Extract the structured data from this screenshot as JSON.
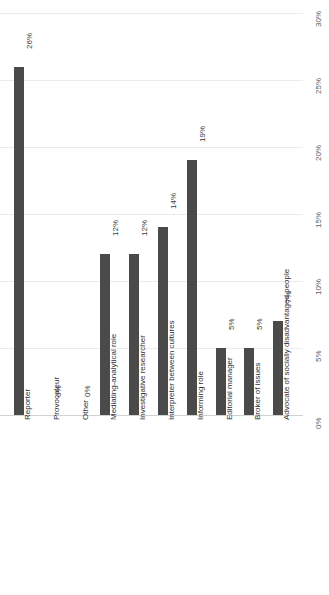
{
  "chart_data": {
    "type": "bar",
    "title": "",
    "xlabel": "",
    "ylabel": "",
    "ylim": [
      0,
      30
    ],
    "orientation": "vertical-rotated",
    "grid": true,
    "legend": "none",
    "axis_ticks": [
      "0%",
      "5%",
      "10%",
      "15%",
      "20%",
      "25%",
      "30%"
    ],
    "axis_tick_values": [
      0,
      5,
      10,
      15,
      20,
      25,
      30
    ],
    "bar_color": "#4a4a4a",
    "grid_color": "#ebebeb",
    "categories": [
      "Reporter",
      "Provocateur",
      "Other",
      "Mediating-analytical role",
      "Investigative researcher",
      "Interpreter between cultures",
      "Informing role",
      "Editorial manager",
      "Broker of issues",
      "Advocate of socially disadvantaged people"
    ],
    "values": [
      26,
      0,
      0,
      12,
      12,
      14,
      19,
      5,
      5,
      7
    ],
    "data_labels": [
      "26%",
      "0%",
      "0%",
      "12%",
      "12%",
      "14%",
      "19%",
      "5%",
      "5%",
      "7%"
    ]
  }
}
